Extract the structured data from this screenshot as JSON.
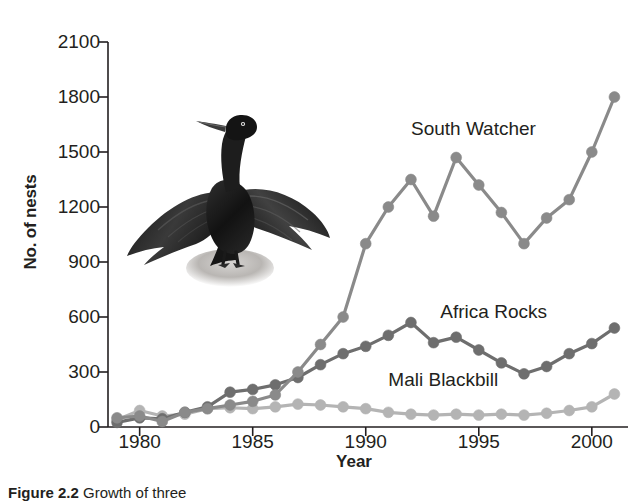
{
  "figure": {
    "caption_label": "Figure 2.2",
    "caption_body": " Growth of three"
  },
  "axes": {
    "ylabel": "No. of nests",
    "xlabel": "Year",
    "yticks": [
      0,
      300,
      600,
      900,
      1200,
      1500,
      1800,
      2100
    ],
    "xticks": [
      1980,
      1985,
      1990,
      1995,
      2000
    ],
    "ylim": [
      0,
      2100
    ],
    "xlim": [
      1978.6,
      2001.6
    ]
  },
  "illustration": {
    "name": "cormorant-bird-illustration",
    "description": "Black cormorant with outstretched wings perched on a rock"
  },
  "colors": {
    "axis": "#231f20",
    "text": "#231f20",
    "south_watcher": "#8a8a8a",
    "africa_rocks": "#6e6e6e",
    "mali_blackbill": "#b4b4b4",
    "background": "#ffffff"
  },
  "chart_data": {
    "type": "line",
    "title": "",
    "xlabel": "Year",
    "ylabel": "No. of nests",
    "xlim": [
      1978.6,
      2001.6
    ],
    "ylim": [
      0,
      2100
    ],
    "grid": false,
    "legend": "inline-annotations",
    "x": [
      1979,
      1980,
      1981,
      1982,
      1983,
      1984,
      1985,
      1986,
      1987,
      1988,
      1989,
      1990,
      1991,
      1992,
      1993,
      1994,
      1995,
      1996,
      1997,
      1998,
      1999,
      2000,
      2001
    ],
    "series": [
      {
        "name": "South Watcher",
        "color": "#8a8a8a",
        "label_x": 1992.0,
        "label_y": 1620,
        "values": [
          50,
          60,
          30,
          80,
          100,
          120,
          140,
          175,
          300,
          450,
          600,
          1000,
          1200,
          1350,
          1150,
          1470,
          1320,
          1170,
          1000,
          1140,
          1240,
          1500,
          1800
        ]
      },
      {
        "name": "Africa Rocks",
        "color": "#6e6e6e",
        "label_x": 1993.3,
        "label_y": 620,
        "values": [
          25,
          50,
          45,
          80,
          110,
          190,
          205,
          230,
          270,
          340,
          400,
          440,
          500,
          570,
          460,
          490,
          420,
          350,
          290,
          330,
          400,
          455,
          540
        ]
      },
      {
        "name": "Mali Blackbill",
        "color": "#b4b4b4",
        "label_x": 1991.0,
        "label_y": 250,
        "values": [
          40,
          90,
          60,
          70,
          100,
          105,
          100,
          110,
          125,
          120,
          110,
          100,
          80,
          70,
          65,
          70,
          65,
          70,
          65,
          75,
          90,
          110,
          180
        ]
      }
    ]
  }
}
